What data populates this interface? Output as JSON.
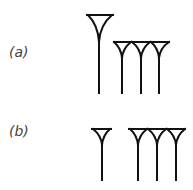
{
  "figure": {
    "panels": [
      {
        "label": "(a)",
        "description": "large wedge followed by three smaller wedges joined at top",
        "wedges": [
          {
            "size": "large",
            "count": 1
          },
          {
            "size": "small",
            "count": 3
          }
        ]
      },
      {
        "label": "(b)",
        "description": "single wedge, gap, then three wedges joined at top",
        "wedges": [
          {
            "size": "small",
            "count": 1
          },
          {
            "size": "small",
            "count": 3
          }
        ]
      }
    ],
    "colors": {
      "stroke": "#111111",
      "label": "#444444",
      "background": "#ffffff"
    }
  }
}
